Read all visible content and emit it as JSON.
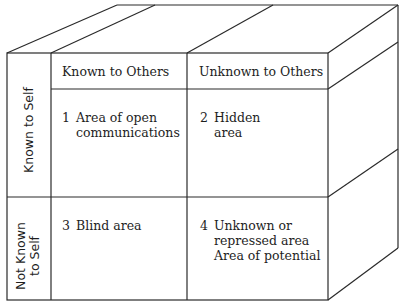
{
  "diagram": {
    "type": "johari-window-cube",
    "columns": [
      {
        "label": "Known to Others"
      },
      {
        "label": "Unknown to Others"
      }
    ],
    "rows": [
      {
        "label": "Known to Self"
      },
      {
        "label_line1": "Not Known",
        "label_line2": "to Self"
      }
    ],
    "cells": [
      {
        "number": "1",
        "lines": [
          "Area of open",
          "communications"
        ]
      },
      {
        "number": "2",
        "lines": [
          "Hidden",
          "area"
        ]
      },
      {
        "number": "3",
        "lines": [
          "Blind area"
        ]
      },
      {
        "number": "4",
        "lines": [
          "Unknown or",
          "repressed area",
          "Area of potential"
        ]
      }
    ],
    "line_color": "#2a2a2a",
    "background": "#ffffff"
  }
}
